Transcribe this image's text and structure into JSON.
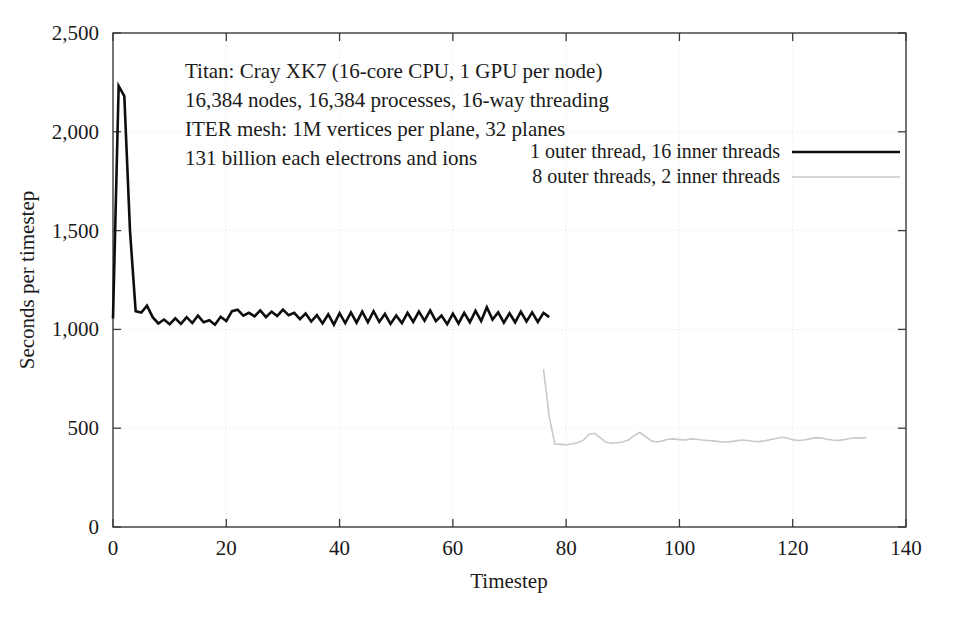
{
  "figure": {
    "background_color": "#ffffff",
    "frame_color": "#3a3a3a"
  },
  "annotation": {
    "lines": [
      "Titan: Cray XK7 (16-core CPU, 1 GPU per node)",
      "16,384 nodes, 16,384 processes, 16-way threading",
      "ITER mesh: 1M vertices per plane, 32 planes",
      "131 billion each electrons and ions"
    ]
  },
  "legend": {
    "position": "inside-top-right",
    "entries": [
      {
        "label": "1 outer thread, 16 inner threads",
        "color": "#0d0d0d",
        "width": 2.6
      },
      {
        "label": "8 outer threads, 2 inner threads",
        "color": "#c9c9c9",
        "width": 1.6
      }
    ]
  },
  "chart_data": {
    "type": "line",
    "title": "",
    "xlabel": "Timestep",
    "ylabel": "Seconds per timestep",
    "xlim": [
      0,
      140
    ],
    "ylim": [
      0,
      2500
    ],
    "xticks": [
      0,
      20,
      40,
      60,
      80,
      100,
      120,
      140
    ],
    "xtick_labels": [
      "0",
      "20",
      "40",
      "60",
      "80",
      "100",
      "120",
      "140"
    ],
    "yticks": [
      0,
      500,
      1000,
      1500,
      2000,
      2500
    ],
    "ytick_labels": [
      "0",
      "500",
      "1,000",
      "1,500",
      "2,000",
      "2,500"
    ],
    "grid": true,
    "grid_style": "dotted",
    "grid_color": "#e3e3e3",
    "legend_position": "upper right",
    "series": [
      {
        "name": "1 outer thread, 16 inner threads",
        "color": "#0d0d0d",
        "width": 2.6,
        "x": [
          0,
          1,
          2,
          3,
          4,
          5,
          6,
          7,
          8,
          9,
          10,
          11,
          12,
          13,
          14,
          15,
          16,
          17,
          18,
          19,
          20,
          21,
          22,
          23,
          24,
          25,
          26,
          27,
          28,
          29,
          30,
          31,
          32,
          33,
          34,
          35,
          36,
          37,
          38,
          39,
          40,
          41,
          42,
          43,
          44,
          45,
          46,
          47,
          48,
          49,
          50,
          51,
          52,
          53,
          54,
          55,
          56,
          57,
          58,
          59,
          60,
          61,
          62,
          63,
          64,
          65,
          66,
          67,
          68,
          69,
          70,
          71,
          72,
          73,
          74,
          75,
          76,
          77
        ],
        "values": [
          1055,
          2232,
          2180,
          1500,
          1092,
          1085,
          1120,
          1062,
          1030,
          1050,
          1026,
          1056,
          1028,
          1062,
          1032,
          1070,
          1036,
          1046,
          1024,
          1064,
          1042,
          1092,
          1100,
          1070,
          1084,
          1066,
          1096,
          1062,
          1090,
          1068,
          1100,
          1072,
          1084,
          1052,
          1080,
          1040,
          1072,
          1030,
          1076,
          1024,
          1082,
          1032,
          1086,
          1034,
          1090,
          1036,
          1092,
          1038,
          1078,
          1028,
          1070,
          1032,
          1084,
          1038,
          1090,
          1044,
          1096,
          1042,
          1070,
          1026,
          1080,
          1030,
          1084,
          1036,
          1094,
          1042,
          1112,
          1050,
          1086,
          1034,
          1082,
          1036,
          1090,
          1040,
          1086,
          1038,
          1084,
          1062
        ]
      },
      {
        "name": "8 outer threads, 2 inner threads",
        "color": "#c9c9c9",
        "width": 1.6,
        "x": [
          76,
          77,
          78,
          79,
          80,
          81,
          82,
          83,
          84,
          85,
          86,
          87,
          88,
          89,
          90,
          91,
          92,
          93,
          94,
          95,
          96,
          97,
          98,
          99,
          100,
          101,
          102,
          103,
          104,
          105,
          106,
          107,
          108,
          109,
          110,
          111,
          112,
          113,
          114,
          115,
          116,
          117,
          118,
          119,
          120,
          121,
          122,
          123,
          124,
          125,
          126,
          127,
          128,
          129,
          130,
          131,
          132,
          133
        ],
        "values": [
          800,
          560,
          420,
          418,
          416,
          420,
          426,
          438,
          468,
          474,
          452,
          430,
          424,
          426,
          430,
          440,
          462,
          478,
          458,
          436,
          430,
          436,
          444,
          446,
          442,
          440,
          446,
          444,
          440,
          438,
          436,
          432,
          430,
          432,
          436,
          440,
          438,
          434,
          432,
          436,
          442,
          448,
          454,
          450,
          442,
          438,
          440,
          446,
          452,
          450,
          444,
          440,
          438,
          442,
          448,
          452,
          450,
          452
        ]
      }
    ]
  }
}
